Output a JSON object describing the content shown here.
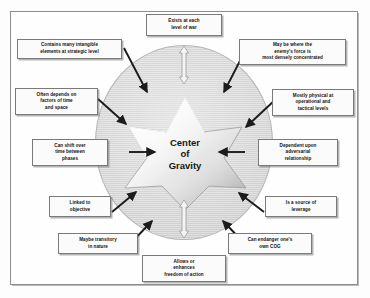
{
  "diagram": {
    "center": {
      "line1": "Center",
      "line2": "of",
      "line3": "Gravity",
      "shape": "six-pointed-star",
      "fill_color": "#e9e9e9"
    },
    "circle": {
      "color": "#d7d7d7",
      "border_color": "#b5b5b5"
    },
    "frame": {
      "border_color": "#8e8e8e"
    },
    "callouts": [
      {
        "id": "top",
        "text": "Exists at each\nlevel of war"
      },
      {
        "id": "top-left",
        "text": "Contains many intangible\nelements at strategic level"
      },
      {
        "id": "top-right",
        "text": "May be where the\nenemy's force is\nmost densely concentrated"
      },
      {
        "id": "upper-left",
        "text": "Often depends on\nfactors of time\nand space"
      },
      {
        "id": "upper-right",
        "text": "Mostly physical at\noperational and\ntactical levels"
      },
      {
        "id": "mid-left",
        "text": "Can shift over\ntime between\nphases"
      },
      {
        "id": "mid-right",
        "text": "Dependent upon\nadversarial\nrelationship"
      },
      {
        "id": "lower-left",
        "text": "Linked to\nobjective"
      },
      {
        "id": "lower-right",
        "text": "Is a source of\nleverage"
      },
      {
        "id": "bottom-left",
        "text": "Maybe transitory\nin nature"
      },
      {
        "id": "bottom-right",
        "text": "Can endanger one's\nown COG"
      },
      {
        "id": "bottom",
        "text": "Allows or\nenhances\nfreedom of action"
      }
    ],
    "arrows": {
      "solid_color": "#1b1b1b",
      "hollow_color": "#9a9a9a",
      "count_solid": 8,
      "count_hollow": 2
    }
  }
}
